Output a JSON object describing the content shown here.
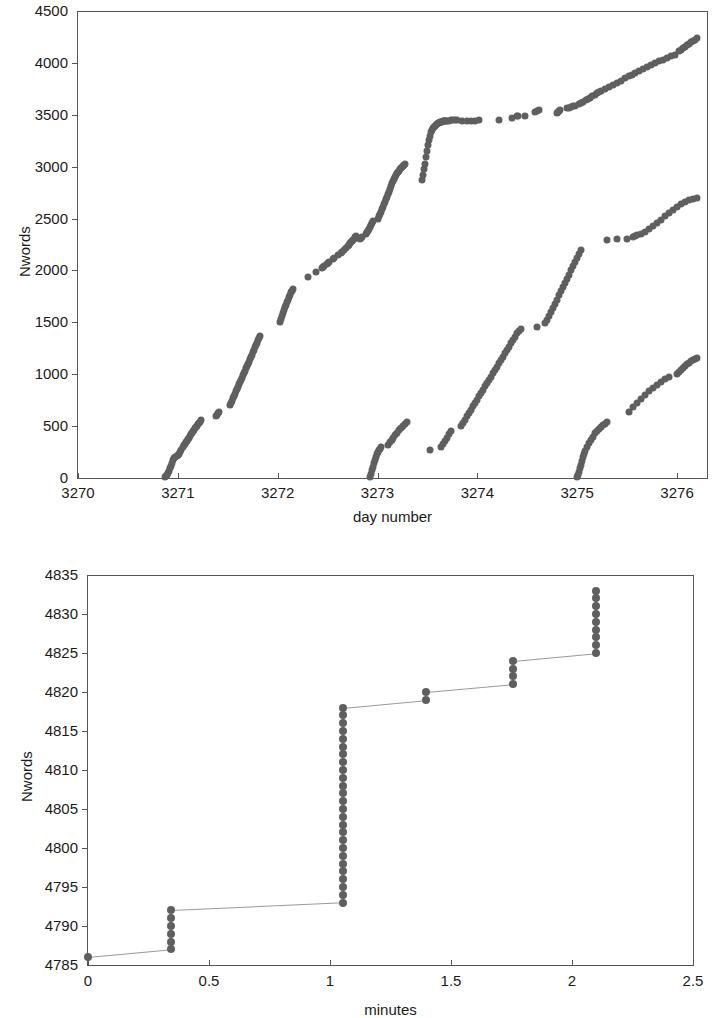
{
  "figure": {
    "background": "#ffffff",
    "marker_color": "#5f5f5f",
    "line_color": "#9a9a9a",
    "axis_color": "#555555"
  },
  "chart_data": [
    {
      "id": "top",
      "type": "scatter",
      "title": "",
      "xlabel": "day number",
      "ylabel": "Nwords",
      "xlim": [
        3270,
        3276.3
      ],
      "ylim": [
        0,
        4500
      ],
      "xticks": [
        3270,
        3271,
        3272,
        3273,
        3274,
        3275,
        3276
      ],
      "xtick_labels": [
        "3270",
        "3271",
        "3272",
        "3273",
        "3274",
        "3275",
        "3276"
      ],
      "yticks": [
        0,
        500,
        1000,
        1500,
        2000,
        2500,
        3000,
        3500,
        4000,
        4500
      ],
      "ytick_labels": [
        "0",
        "500",
        "1000",
        "1500",
        "2000",
        "2500",
        "3000",
        "3500",
        "4000",
        "4500"
      ],
      "grid": false,
      "legend": "none",
      "series": [
        {
          "name": "session-1",
          "x": [
            3270.87,
            3270.88,
            3270.89,
            3270.9,
            3270.91,
            3270.92,
            3270.93,
            3270.94,
            3270.95,
            3270.96,
            3270.97,
            3270.99,
            3271.0,
            3271.01,
            3271.02,
            3271.03,
            3271.05,
            3271.06,
            3271.07,
            3271.08,
            3271.09,
            3271.1,
            3271.11,
            3271.12,
            3271.13,
            3271.14,
            3271.15,
            3271.16,
            3271.17,
            3271.18,
            3271.19,
            3271.2,
            3271.21,
            3271.22,
            3271.23,
            3271.38,
            3271.39,
            3271.4,
            3271.41,
            3271.52,
            3271.53,
            3271.54,
            3271.55,
            3271.56,
            3271.57,
            3271.58,
            3271.59,
            3271.6,
            3271.61,
            3271.62,
            3271.63,
            3271.64,
            3271.65,
            3271.66,
            3271.67,
            3271.68,
            3271.69,
            3271.7,
            3271.71,
            3271.72,
            3271.73,
            3271.74,
            3271.75,
            3271.76,
            3271.77,
            3271.78,
            3271.79,
            3271.8,
            3271.81,
            3271.82,
            3272.02,
            3272.03,
            3272.04,
            3272.05,
            3272.06,
            3272.07,
            3272.08,
            3272.09,
            3272.1,
            3272.11,
            3272.12,
            3272.13,
            3272.14,
            3272.15,
            3272.3,
            3272.38,
            3272.44,
            3272.45,
            3272.46,
            3272.49,
            3272.5,
            3272.51,
            3272.55,
            3272.56,
            3272.6,
            3272.63,
            3272.64,
            3272.66,
            3272.68,
            3272.7,
            3272.71,
            3272.72,
            3272.73,
            3272.74,
            3272.75,
            3272.76,
            3272.77,
            3272.78,
            3272.82,
            3272.83,
            3272.84,
            3272.88,
            3272.89,
            3272.9,
            3272.91,
            3272.92,
            3272.93,
            3272.94,
            3272.95,
            3273.0,
            3273.01,
            3273.02,
            3273.03,
            3273.04,
            3273.05,
            3273.06,
            3273.07,
            3273.08,
            3273.09,
            3273.1,
            3273.11,
            3273.12,
            3273.13,
            3273.14,
            3273.15,
            3273.17,
            3273.18,
            3273.19,
            3273.2,
            3273.21,
            3273.22,
            3273.23,
            3273.24,
            3273.25,
            3273.26,
            3273.27,
            3273.28,
            3273.45,
            3273.46,
            3273.47,
            3273.48,
            3273.49,
            3273.5,
            3273.51,
            3273.52,
            3273.53,
            3273.54,
            3273.55,
            3273.56,
            3273.57,
            3273.58,
            3273.59,
            3273.6,
            3273.61,
            3273.62,
            3273.63,
            3273.64,
            3273.65,
            3273.66,
            3273.67,
            3273.68,
            3273.69,
            3273.7,
            3273.72,
            3273.74,
            3273.76,
            3273.78,
            3273.8,
            3273.85,
            3273.9,
            3273.94,
            3273.98,
            3274.02,
            3274.22,
            3274.35,
            3274.4,
            3274.41,
            3274.48,
            3274.58,
            3274.6,
            3274.62,
            3274.8,
            3274.81,
            3274.82,
            3274.83,
            3274.9,
            3274.92,
            3274.94,
            3274.96,
            3274.98,
            3275.02,
            3275.04,
            3275.06,
            3275.09,
            3275.11,
            3275.13,
            3275.15,
            3275.18,
            3275.2,
            3275.22,
            3275.24,
            3275.28,
            3275.32,
            3275.36,
            3275.4,
            3275.44,
            3275.48,
            3275.52,
            3275.55,
            3275.58,
            3275.62,
            3275.66,
            3275.7,
            3275.74,
            3275.78,
            3275.82,
            3275.86,
            3275.9,
            3275.94,
            3275.98,
            3276.02,
            3276.04,
            3276.06,
            3276.08,
            3276.1,
            3276.12,
            3276.14,
            3276.16,
            3276.18,
            3276.2
          ],
          "y": [
            5,
            15,
            30,
            48,
            70,
            95,
            120,
            145,
            170,
            190,
            205,
            215,
            222,
            232,
            248,
            268,
            300,
            318,
            332,
            348,
            360,
            372,
            388,
            402,
            420,
            438,
            452,
            466,
            480,
            492,
            506,
            520,
            532,
            544,
            556,
            600,
            612,
            624,
            636,
            700,
            720,
            744,
            768,
            790,
            812,
            836,
            858,
            880,
            902,
            922,
            944,
            968,
            990,
            1010,
            1032,
            1056,
            1078,
            1100,
            1122,
            1144,
            1168,
            1190,
            1212,
            1236,
            1258,
            1280,
            1302,
            1326,
            1348,
            1370,
            1500,
            1530,
            1560,
            1588,
            1616,
            1644,
            1670,
            1696,
            1720,
            1744,
            1766,
            1788,
            1806,
            1824,
            1940,
            1988,
            2020,
            2030,
            2040,
            2060,
            2072,
            2084,
            2110,
            2120,
            2150,
            2172,
            2182,
            2200,
            2216,
            2238,
            2250,
            2260,
            2272,
            2284,
            2296,
            2306,
            2318,
            2330,
            2300,
            2312,
            2324,
            2350,
            2366,
            2382,
            2398,
            2418,
            2436,
            2454,
            2472,
            2500,
            2520,
            2544,
            2566,
            2590,
            2612,
            2636,
            2660,
            2684,
            2710,
            2736,
            2760,
            2786,
            2812,
            2838,
            2860,
            2880,
            2900,
            2920,
            2940,
            2950,
            2960,
            2975,
            2990,
            3000,
            3010,
            3020,
            3030,
            2870,
            2920,
            2975,
            3030,
            3090,
            3150,
            3210,
            3260,
            3300,
            3330,
            3352,
            3368,
            3380,
            3392,
            3402,
            3410,
            3418,
            3424,
            3428,
            3432,
            3434,
            3436,
            3438,
            3440,
            3442,
            3443,
            3444,
            3446,
            3448,
            3450,
            3452,
            3440,
            3442,
            3440,
            3444,
            3448,
            3450,
            3470,
            3490,
            3492,
            3490,
            3530,
            3540,
            3545,
            3520,
            3528,
            3536,
            3544,
            3562,
            3568,
            3574,
            3580,
            3588,
            3600,
            3612,
            3624,
            3638,
            3652,
            3666,
            3680,
            3694,
            3706,
            3718,
            3730,
            3750,
            3772,
            3790,
            3810,
            3830,
            3850,
            3870,
            3888,
            3906,
            3924,
            3942,
            3960,
            3978,
            3996,
            4014,
            4030,
            4046,
            4062,
            4078,
            4110,
            4126,
            4142,
            4158,
            4172,
            4186,
            4200,
            4212,
            4224,
            4236
          ]
        },
        {
          "name": "session-2",
          "x": [
            3272.92,
            3272.93,
            3272.94,
            3272.95,
            3272.96,
            3272.97,
            3272.98,
            3272.99,
            3273.0,
            3273.01,
            3273.02,
            3273.03,
            3273.1,
            3273.12,
            3273.14,
            3273.16,
            3273.18,
            3273.2,
            3273.22,
            3273.24,
            3273.26,
            3273.28,
            3273.3,
            3273.53,
            3273.64,
            3273.66,
            3273.68,
            3273.7,
            3273.72,
            3273.74,
            3273.84,
            3273.86,
            3273.88,
            3273.9,
            3273.92,
            3273.94,
            3273.96,
            3273.98,
            3274.0,
            3274.02,
            3274.04,
            3274.06,
            3274.08,
            3274.1,
            3274.12,
            3274.14,
            3274.16,
            3274.18,
            3274.2,
            3274.22,
            3274.24,
            3274.26,
            3274.28,
            3274.3,
            3274.32,
            3274.34,
            3274.36,
            3274.38,
            3274.4,
            3274.42,
            3274.44,
            3274.6,
            3274.68,
            3274.7,
            3274.72,
            3274.74,
            3274.76,
            3274.78,
            3274.8,
            3274.82,
            3274.84,
            3274.86,
            3274.88,
            3274.9,
            3274.92,
            3274.94,
            3274.96,
            3274.98,
            3275.0,
            3275.02,
            3275.04,
            3275.3,
            3275.4,
            3275.5,
            3275.56,
            3275.58,
            3275.6,
            3275.64,
            3275.68,
            3275.72,
            3275.76,
            3275.8,
            3275.84,
            3275.88,
            3275.92,
            3275.96,
            3276.0,
            3276.04,
            3276.08,
            3276.12,
            3276.16,
            3276.2
          ],
          "y": [
            10,
            40,
            75,
            110,
            145,
            175,
            205,
            230,
            252,
            270,
            284,
            296,
            320,
            344,
            368,
            390,
            412,
            436,
            458,
            478,
            498,
            518,
            536,
            270,
            300,
            330,
            360,
            390,
            420,
            450,
            500,
            530,
            562,
            594,
            626,
            658,
            690,
            722,
            754,
            786,
            818,
            850,
            882,
            914,
            946,
            978,
            1010,
            1042,
            1074,
            1106,
            1138,
            1170,
            1202,
            1234,
            1266,
            1298,
            1330,
            1362,
            1394,
            1420,
            1440,
            1460,
            1490,
            1520,
            1560,
            1600,
            1640,
            1680,
            1720,
            1760,
            1800,
            1840,
            1880,
            1920,
            1960,
            2000,
            2040,
            2080,
            2120,
            2160,
            2200,
            2290,
            2300,
            2300,
            2320,
            2330,
            2340,
            2350,
            2370,
            2400,
            2430,
            2460,
            2490,
            2520,
            2550,
            2580,
            2610,
            2640,
            2660,
            2680,
            2690,
            2700
          ]
        },
        {
          "name": "session-3",
          "x": [
            3275.0,
            3275.01,
            3275.02,
            3275.03,
            3275.04,
            3275.05,
            3275.06,
            3275.07,
            3275.08,
            3275.1,
            3275.12,
            3275.14,
            3275.16,
            3275.18,
            3275.2,
            3275.22,
            3275.24,
            3275.26,
            3275.28,
            3275.3,
            3275.52,
            3275.56,
            3275.6,
            3275.64,
            3275.68,
            3275.72,
            3275.76,
            3275.8,
            3275.84,
            3275.88,
            3275.92,
            3276.0,
            3276.02,
            3276.04,
            3276.06,
            3276.08,
            3276.1,
            3276.12,
            3276.14,
            3276.16,
            3276.18,
            3276.2
          ],
          "y": [
            8,
            30,
            60,
            95,
            130,
            165,
            200,
            235,
            265,
            300,
            335,
            370,
            400,
            430,
            455,
            475,
            495,
            510,
            525,
            540,
            640,
            680,
            720,
            760,
            800,
            840,
            870,
            900,
            930,
            950,
            970,
            1000,
            1020,
            1040,
            1060,
            1080,
            1095,
            1110,
            1125,
            1138,
            1150,
            1160
          ]
        }
      ]
    },
    {
      "id": "bottom",
      "type": "line",
      "title": "",
      "xlabel": "minutes",
      "ylabel": "Nwords",
      "xlim": [
        0,
        2.5
      ],
      "ylim": [
        4785,
        4835
      ],
      "xticks": [
        0,
        0.5,
        1,
        1.5,
        2,
        2.5
      ],
      "xtick_labels": [
        "0",
        "0.5",
        "1",
        "1.5",
        "2",
        "2.5"
      ],
      "yticks": [
        4785,
        4790,
        4795,
        4800,
        4805,
        4810,
        4815,
        4820,
        4825,
        4830,
        4835
      ],
      "ytick_labels": [
        "4785",
        "4790",
        "4795",
        "4800",
        "4805",
        "4810",
        "4815",
        "4820",
        "4825",
        "4830",
        "4835"
      ],
      "grid": false,
      "legend": "none",
      "series": [
        {
          "name": "typing-progress",
          "x": [
            0.0,
            0.345,
            0.345,
            0.345,
            0.345,
            0.345,
            0.345,
            1.055,
            1.055,
            1.055,
            1.055,
            1.055,
            1.055,
            1.055,
            1.055,
            1.055,
            1.055,
            1.055,
            1.055,
            1.055,
            1.055,
            1.055,
            1.055,
            1.055,
            1.055,
            1.055,
            1.055,
            1.055,
            1.055,
            1.055,
            1.055,
            1.055,
            1.055,
            1.395,
            1.395,
            1.755,
            1.755,
            1.755,
            1.755,
            2.1,
            2.1,
            2.1,
            2.1,
            2.1,
            2.1,
            2.1,
            2.1,
            2.1
          ],
          "y": [
            4786,
            4787,
            4788,
            4789,
            4790,
            4791,
            4792,
            4793,
            4794,
            4795,
            4796,
            4797,
            4798,
            4799,
            4800,
            4801,
            4802,
            4803,
            4804,
            4805,
            4806,
            4807,
            4808,
            4809,
            4810,
            4811,
            4812,
            4813,
            4814,
            4815,
            4816,
            4817,
            4818,
            4819,
            4820,
            4821,
            4822,
            4823,
            4824,
            4825,
            4826,
            4827,
            4828,
            4829,
            4830,
            4831,
            4832,
            4833,
            4834,
            4835
          ]
        }
      ]
    }
  ]
}
